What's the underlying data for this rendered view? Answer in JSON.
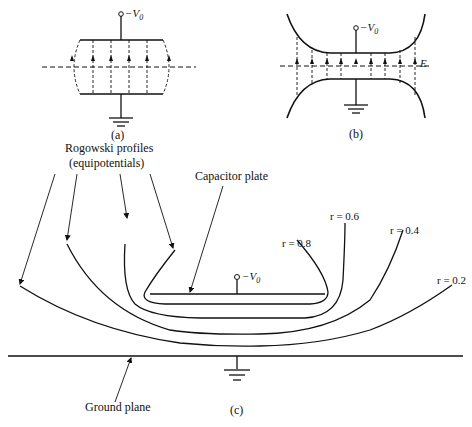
{
  "figure_a": {
    "terminal_label": "−V",
    "terminal_sub": "0",
    "caption": "(a)",
    "field_lines": 6
  },
  "figure_b": {
    "terminal_label": "−V",
    "terminal_sub": "0",
    "field_label": "E",
    "caption": "(b)",
    "field_lines": 9
  },
  "figure_c": {
    "rogowski_label_line1": "Rogowski profiles",
    "rogowski_label_line2": "(equipotentials)",
    "capacitor_label": "Capacitor plate",
    "terminal_label": "−V",
    "terminal_sub": "0",
    "ground_label": "Ground plane",
    "caption": "(c)",
    "equipotentials": [
      {
        "label": "r = 0.8"
      },
      {
        "label": "r = 0.6"
      },
      {
        "label": "r = 0.4"
      },
      {
        "label": "r = 0.2"
      }
    ]
  },
  "colors": {
    "line": "#111111",
    "background": "#ffffff"
  }
}
